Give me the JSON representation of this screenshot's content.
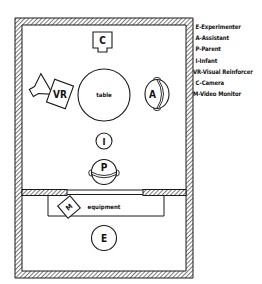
{
  "diagram": {
    "room": {
      "label_table": "table",
      "label_equipment": "equipment"
    },
    "figures": {
      "camera": "C",
      "visual_reinforcer": "VR",
      "assistant": "A",
      "infant": "I",
      "parent": "P",
      "video_monitor": "M",
      "experimenter": "E"
    },
    "colors": {
      "line": "#1a1a1a",
      "background": "#ffffff"
    }
  },
  "legend": {
    "items": [
      "E-Experimenter",
      "A-Assistant",
      "P-Parent",
      "I-Infant",
      "VR-Visual Reinforcer",
      "C-Camera",
      "M-Video Monitor"
    ]
  }
}
